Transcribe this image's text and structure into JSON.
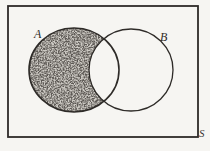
{
  "figure": {
    "kind": "venn-diagram",
    "labels": {
      "set_a": "A",
      "set_b": "B",
      "universe": "S"
    },
    "shaded_region": "A minus B",
    "colors": {
      "ink": "#2e2b28",
      "paper": "#f6f5f2",
      "stipple_base": "#cdcac4",
      "stipple_ink": "#26231f"
    }
  }
}
